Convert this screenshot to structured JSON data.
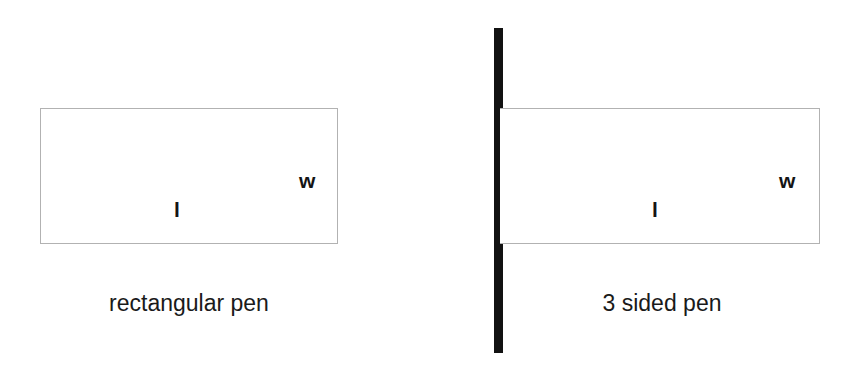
{
  "page": {
    "background_color": "#ffffff",
    "width": 855,
    "height": 373
  },
  "figures": [
    {
      "id": "rectangular-pen",
      "caption": "rectangular pen",
      "shape": "closed-rectangle",
      "sides_fenced": 4,
      "stroke_color": "#b2b2b2",
      "fill_color": "#ffffff",
      "labels": {
        "length": "l",
        "width": "w"
      }
    },
    {
      "id": "three-sided-pen",
      "caption": "3 sided pen",
      "shape": "open-rectangle",
      "sides_fenced": 3,
      "stroke_color": "#b2b2b2",
      "fill_color": "#ffffff",
      "wall_color": "#121212",
      "wall_description": "existing wall",
      "labels": {
        "length": "l",
        "width": "w"
      }
    }
  ]
}
